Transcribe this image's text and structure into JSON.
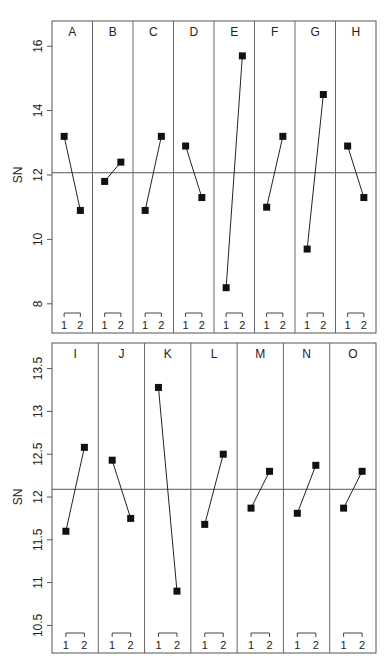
{
  "chart_data": [
    {
      "type": "line",
      "title": "",
      "ylabel": "SN",
      "xlabel": "",
      "ylim": [
        7.2,
        16.9
      ],
      "yticks": [
        8,
        10,
        12,
        14,
        16
      ],
      "ytick_labels": [
        "8",
        "10",
        "12",
        "14",
        "16"
      ],
      "reference_line": 12.07,
      "grid": false,
      "legend": null,
      "level_labels": [
        "1",
        "2"
      ],
      "factors": [
        {
          "name": "A",
          "values": [
            13.2,
            10.9
          ]
        },
        {
          "name": "B",
          "values": [
            11.8,
            12.4
          ]
        },
        {
          "name": "C",
          "values": [
            10.9,
            13.2
          ]
        },
        {
          "name": "D",
          "values": [
            12.9,
            11.3
          ]
        },
        {
          "name": "E",
          "values": [
            8.5,
            15.7
          ]
        },
        {
          "name": "F",
          "values": [
            11.0,
            13.2
          ]
        },
        {
          "name": "G",
          "values": [
            9.7,
            14.5
          ]
        },
        {
          "name": "H",
          "values": [
            12.9,
            11.3
          ]
        }
      ]
    },
    {
      "type": "line",
      "title": "",
      "ylabel": "SN",
      "xlabel": "",
      "ylim": [
        10.2,
        13.85
      ],
      "yticks": [
        10.5,
        11,
        11.5,
        12,
        12.5,
        13,
        13.5
      ],
      "ytick_labels": [
        "10.5",
        "11",
        "11.5",
        "12",
        "12.5",
        "13",
        "13.5"
      ],
      "reference_line": 12.09,
      "grid": false,
      "legend": null,
      "level_labels": [
        "1",
        "2"
      ],
      "factors": [
        {
          "name": "I",
          "values": [
            11.6,
            12.58
          ]
        },
        {
          "name": "J",
          "values": [
            12.43,
            11.75
          ]
        },
        {
          "name": "K",
          "values": [
            13.28,
            10.9
          ]
        },
        {
          "name": "L",
          "values": [
            11.68,
            12.5
          ]
        },
        {
          "name": "M",
          "values": [
            11.87,
            12.3
          ]
        },
        {
          "name": "N",
          "values": [
            11.81,
            12.37
          ]
        },
        {
          "name": "O",
          "values": [
            11.87,
            12.3
          ]
        }
      ]
    }
  ],
  "layout": {
    "panels": [
      {
        "x0": 52,
        "x1": 376,
        "y0": 21,
        "y1": 333,
        "val_ref": 12,
        "y_ref": 175,
        "px_per_unit": 32.2
      },
      {
        "x0": 52,
        "x1": 376,
        "y0": 343,
        "y1": 653,
        "val_ref": 12,
        "y_ref": 497,
        "px_per_unit": 85.6
      }
    ]
  }
}
